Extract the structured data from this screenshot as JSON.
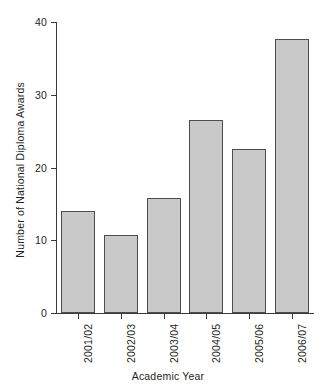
{
  "chart_data": {
    "type": "bar",
    "title": "",
    "xlabel": "Academic Year",
    "ylabel": "Number of National Diploma Awards",
    "categories": [
      "2001/02",
      "2002/03",
      "2003/04",
      "2004/05",
      "2005/06",
      "2006/07"
    ],
    "values": [
      14.0,
      10.7,
      15.8,
      26.5,
      22.5,
      37.7
    ],
    "ylim": [
      0,
      40
    ],
    "yticks": [
      0,
      10,
      20,
      30,
      40
    ],
    "ytick_labels": [
      "0",
      "10",
      "20",
      "30",
      "40"
    ],
    "grid": false,
    "legend": false,
    "bar_fill_color": "#c9c9c9",
    "bar_edge_color": "#4d4d4d",
    "axis_color": "#3a3a3a",
    "background_color": "#ffffff",
    "series": [
      {
        "name": "National Diploma Awards",
        "values": [
          14.0,
          10.7,
          15.8,
          26.5,
          22.5,
          37.7
        ]
      }
    ]
  }
}
